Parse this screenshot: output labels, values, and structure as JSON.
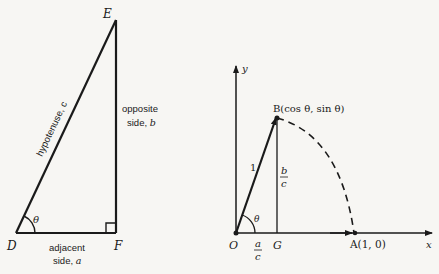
{
  "left_triangle": {
    "vertices": {
      "D": {
        "label": "D",
        "x": 16,
        "y": 233
      },
      "E": {
        "label": "E",
        "x": 116,
        "y": 20
      },
      "F": {
        "label": "F",
        "x": 116,
        "y": 233
      }
    },
    "angle_label": "θ",
    "hypotenuse_label": "hypotenuse, c",
    "opposite_label_line1": "opposite",
    "opposite_label_line2_prefix": "side, ",
    "opposite_label_line2_var": "b",
    "adjacent_label_line1": "adjacent",
    "adjacent_label_line2_prefix": "side, ",
    "adjacent_label_line2_var": "a"
  },
  "unit_circle": {
    "origin_label": "O",
    "x_axis_label": "x",
    "y_axis_label": "y",
    "point_B_label": "B(cos θ, sin θ)",
    "point_A_label": "A(1, 0)",
    "foot_label": "G",
    "radius_label": "1",
    "angle_label": "θ",
    "vertical_fraction": {
      "num": "b",
      "den": "c"
    },
    "horizontal_fraction": {
      "num": "a",
      "den": "c"
    },
    "points": {
      "O": {
        "x": 236,
        "y": 233
      },
      "B": {
        "x": 276,
        "y": 118
      },
      "G": {
        "x": 276,
        "y": 233
      },
      "A": {
        "x": 355,
        "y": 233
      }
    }
  },
  "colors": {
    "ink": "#1a1a1a",
    "paper": "#f7f6f3"
  }
}
